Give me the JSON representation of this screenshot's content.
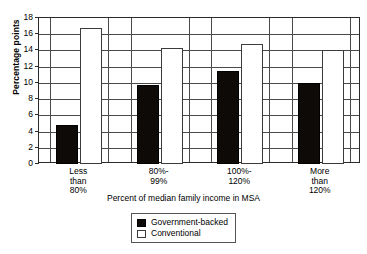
{
  "chart_data": {
    "type": "bar",
    "title": "",
    "xlabel": "Percent of median family income in MSA",
    "ylabel": "Percentage points",
    "categories": [
      "Less than 80%",
      "80%-99%",
      "100%-120%",
      "More than 120%"
    ],
    "category_lines": [
      [
        "Less",
        "than",
        "80%"
      ],
      [
        "80%-",
        "99%"
      ],
      [
        "100%-",
        "120%"
      ],
      [
        "More",
        "than",
        "120%"
      ]
    ],
    "series": [
      {
        "name": "Government-backed",
        "color": "#0d0a08",
        "values": [
          4.8,
          9.7,
          11.5,
          10.0
        ]
      },
      {
        "name": "Conventional",
        "color": "#ffffff",
        "values": [
          16.8,
          14.3,
          14.8,
          14.0
        ]
      }
    ],
    "ylim": [
      0,
      18
    ],
    "yticks": [
      0,
      2,
      4,
      6,
      8,
      10,
      12,
      14,
      16,
      18
    ],
    "ytick_labels": [
      "0",
      "2",
      "4",
      "6",
      "8",
      "10",
      "12",
      "14",
      "16",
      "18"
    ],
    "grid": true,
    "grid_axis": "both",
    "legend_position": "bottom-center"
  },
  "legend": {
    "items": [
      {
        "label": "Government-backed",
        "swatch": "filled-black-square"
      },
      {
        "label": "Conventional",
        "swatch": "open-white-square"
      }
    ]
  }
}
